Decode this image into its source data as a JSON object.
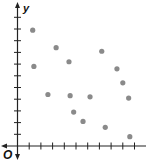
{
  "chart_data": {
    "type": "scatter",
    "title": "",
    "xlabel": "",
    "ylabel": "y",
    "origin_label": "O",
    "xlim": [
      0,
      10.9
    ],
    "ylim": [
      0,
      11.9
    ],
    "x_ticks": [
      1,
      2,
      3,
      4,
      5,
      6,
      7,
      8,
      9,
      10
    ],
    "y_ticks": [
      1,
      2,
      3,
      4,
      5,
      6,
      7,
      8,
      9,
      10,
      11
    ],
    "tick_labels_shown": false,
    "grid": false,
    "legend": null,
    "points": [
      {
        "x": 1.3,
        "y": 9.9
      },
      {
        "x": 1.4,
        "y": 6.8
      },
      {
        "x": 3.3,
        "y": 8.4
      },
      {
        "x": 4.4,
        "y": 7.2
      },
      {
        "x": 2.6,
        "y": 4.4
      },
      {
        "x": 4.5,
        "y": 4.3
      },
      {
        "x": 4.8,
        "y": 2.9
      },
      {
        "x": 5.6,
        "y": 2.1
      },
      {
        "x": 6.2,
        "y": 4.2
      },
      {
        "x": 7.2,
        "y": 8.1
      },
      {
        "x": 7.5,
        "y": 1.6
      },
      {
        "x": 8.5,
        "y": 6.6
      },
      {
        "x": 9.0,
        "y": 5.4
      },
      {
        "x": 9.5,
        "y": 4.1
      },
      {
        "x": 9.6,
        "y": 0.8
      }
    ],
    "colors": {
      "axis": "#222222",
      "point": "#8a8a8a"
    }
  }
}
